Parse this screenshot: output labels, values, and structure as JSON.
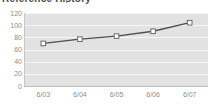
{
  "widget": {
    "title": "Reference History",
    "title_clipped": true,
    "background": "#ffffff"
  },
  "style": {
    "plot_background": "#e2e2e2",
    "gridline_color": "#f7f7f7",
    "line_color": "#4d4d4d",
    "marker_fill": "#ffffff",
    "marker_stroke": "#6b6b6b",
    "tick_label_color": "#8d8d8d",
    "axis_color": "#bdbdbd"
  },
  "chart_data": {
    "type": "line",
    "title": "Reference History",
    "xlabel": "",
    "ylabel": "",
    "categories": [
      "6/03",
      "6/04",
      "6/05",
      "6/06",
      "6/07"
    ],
    "values": [
      70,
      77,
      82,
      90,
      104
    ],
    "series": [
      {
        "name": "Reference History",
        "values": [
          70,
          77,
          82,
          90,
          104
        ]
      }
    ],
    "ylim": [
      0,
      120
    ],
    "yticks": [
      0,
      20,
      40,
      60,
      80,
      100,
      120
    ],
    "ytick_labels": [
      "0",
      "20",
      "40",
      "60",
      "80",
      "100",
      "120"
    ],
    "xtick_labels": [
      "6/03",
      "6/04",
      "6/05",
      "6/06",
      "6/07"
    ],
    "grid": true,
    "grid_axis": "y",
    "legend": false,
    "markers": "square"
  }
}
